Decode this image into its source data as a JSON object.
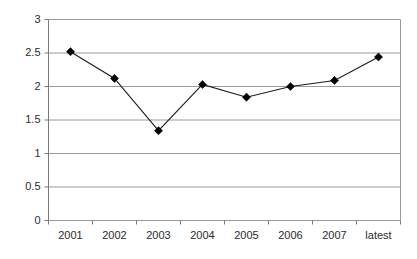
{
  "chart_data": {
    "type": "line",
    "title": "",
    "subtitle": "",
    "xlabel": "",
    "ylabel": "",
    "categories": [
      "2001",
      "2002",
      "2003",
      "2004",
      "2005",
      "2006",
      "2007",
      "latest"
    ],
    "values": [
      2.52,
      2.12,
      1.34,
      2.03,
      1.84,
      2.0,
      2.09,
      2.44
    ],
    "series": [
      {
        "name": "",
        "values": [
          2.52,
          2.12,
          1.34,
          2.03,
          1.84,
          2.0,
          2.09,
          2.44
        ]
      }
    ],
    "ylim": [
      0,
      3
    ],
    "ytick_values": [
      0,
      0.5,
      1,
      1.5,
      2,
      2.5,
      3
    ],
    "ytick_labels": [
      "0",
      "0.5",
      "1",
      "1.5",
      "2",
      "2.5",
      "3"
    ],
    "xtick_labels": [
      "2001",
      "2002",
      "2003",
      "2004",
      "2005",
      "2006",
      "2007",
      "latest"
    ],
    "grid": true,
    "grid_axis": "y",
    "legend": false,
    "legend_position": "none",
    "marker": "diamond",
    "annotations": []
  },
  "style": {
    "background_color": "#ffffff",
    "gridline_color": "#9a9a9a",
    "axis_color": "#7a7a7a",
    "line_color": "#1a1a1a",
    "marker_color": "#000000",
    "tick_text_color": "#2b2b2b"
  }
}
